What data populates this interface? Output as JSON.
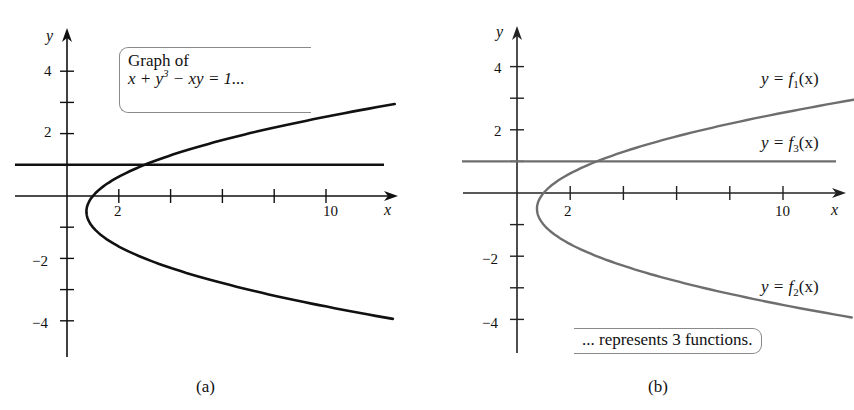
{
  "chart_data": [
    {
      "type": "line",
      "panel": "a",
      "title": "",
      "caption": "(a)",
      "xlabel": "x",
      "ylabel": "y",
      "xlim": [
        -2,
        12.5
      ],
      "ylim": [
        -4.9,
        5
      ],
      "x_ticks": [
        2,
        4,
        6,
        8,
        10
      ],
      "x_tick_labels": [
        "2",
        "",
        "",
        "",
        "10"
      ],
      "y_ticks": [
        4,
        3,
        2,
        1,
        -1,
        -2,
        -3,
        -4
      ],
      "y_tick_labels": [
        "4",
        "",
        "2",
        "",
        "",
        "−2",
        "",
        "−4"
      ],
      "grid": false,
      "annotation": {
        "line1": "Graph of",
        "line2": "x + y³ − xy = 1..."
      },
      "series": [
        {
          "name": "parabola x = y^2 + y + 1",
          "color": "#111111",
          "y_range": [
            -3.94,
            3.0
          ]
        },
        {
          "name": "line y = 1",
          "color": "#111111",
          "x_range": [
            -2,
            12
          ]
        }
      ]
    },
    {
      "type": "line",
      "panel": "b",
      "title": "",
      "caption": "(b)",
      "xlabel": "x",
      "ylabel": "y",
      "xlim": [
        -2,
        12.5
      ],
      "ylim": [
        -4.9,
        5
      ],
      "x_ticks": [
        2,
        4,
        6,
        8,
        10
      ],
      "x_tick_labels": [
        "2",
        "",
        "",
        "",
        "10"
      ],
      "y_ticks": [
        4,
        3,
        2,
        1,
        -1,
        -2,
        -3,
        -4
      ],
      "y_tick_labels": [
        "4",
        "",
        "2",
        "",
        "",
        "−2",
        "",
        "−4"
      ],
      "grid": false,
      "annotation": {
        "text": "... represents 3 functions."
      },
      "series": [
        {
          "name": "y = f1(x)",
          "color": "#6e6e6e",
          "branch": "upper",
          "y_range": [
            -0.5,
            3.0
          ]
        },
        {
          "name": "y = f2(x)",
          "color": "#6e6e6e",
          "branch": "lower",
          "y_range": [
            -3.94,
            -0.5
          ]
        },
        {
          "name": "y = f3(x)",
          "color": "#6e6e6e",
          "branch": "horizontal line y = 1",
          "x_range": [
            -2,
            12
          ]
        }
      ],
      "legend_labels": {
        "f1": {
          "pre": "y = ",
          "f": "f",
          "sub": "1",
          "post": "(x)"
        },
        "f2": {
          "pre": "y = ",
          "f": "f",
          "sub": "2",
          "post": "(x)"
        },
        "f3": {
          "pre": "y = ",
          "f": "f",
          "sub": "3",
          "post": "(x)"
        }
      }
    }
  ],
  "panel_a": {
    "caption": "(a)",
    "axis_x_label": "x",
    "axis_y_label": "y",
    "tick_2": "2",
    "tick_10": "10",
    "tick_y4": "4",
    "tick_y2": "2",
    "tick_ym2": "−2",
    "tick_ym4": "−4",
    "callout_line1": "Graph of",
    "callout_eq_pre": "x + y",
    "callout_eq_sup": "3",
    "callout_eq_post": " − xy = 1...",
    "curve_color": "#111111"
  },
  "panel_b": {
    "caption": "(b)",
    "axis_x_label": "x",
    "axis_y_label": "y",
    "tick_2": "2",
    "tick_10": "10",
    "tick_y4": "4",
    "tick_y2": "2",
    "tick_ym2": "−2",
    "tick_ym4": "−4",
    "callout_text": "... represents 3 functions.",
    "curve_color": "#6e6e6e",
    "label_f1_pre": "y = ",
    "label_f1_f": "f",
    "label_f1_sub": "1",
    "label_f1_post": "(x)",
    "label_f2_pre": "y = ",
    "label_f2_f": "f",
    "label_f2_sub": "2",
    "label_f2_post": "(x)",
    "label_f3_pre": "y = ",
    "label_f3_f": "f",
    "label_f3_sub": "3",
    "label_f3_post": "(x)"
  }
}
